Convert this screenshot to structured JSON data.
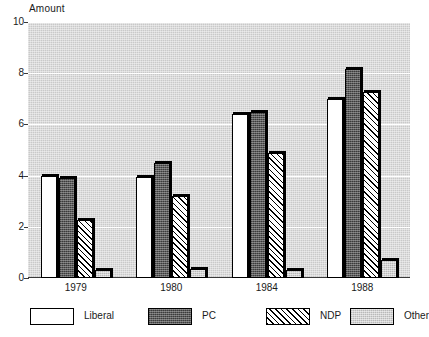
{
  "chart_data": {
    "type": "bar",
    "title": "",
    "subtitle": "",
    "ylabel": "Amount",
    "xlabel": "",
    "categories": [
      "1979",
      "1980",
      "1984",
      "1988"
    ],
    "series": [
      {
        "name": "Liberal",
        "values": [
          4.0,
          3.95,
          6.4,
          7.0
        ],
        "pattern": "solid-white",
        "color": "#ffffff"
      },
      {
        "name": "PC",
        "values": [
          3.9,
          4.5,
          6.5,
          8.15
        ],
        "pattern": "dense-stipple-dark",
        "color": "#5b5b5b"
      },
      {
        "name": "NDP",
        "values": [
          2.25,
          3.2,
          4.9,
          7.25
        ],
        "pattern": "diagonal-hatch",
        "color": "#ffffff"
      },
      {
        "name": "Other",
        "values": [
          0.3,
          0.35,
          0.3,
          0.7
        ],
        "pattern": "light-stipple",
        "color": "#d2d2d2"
      }
    ],
    "ylim": [
      0,
      10
    ],
    "yticks": [
      0,
      2,
      4,
      6,
      8,
      10
    ],
    "ytick_labels": [
      "0",
      "2",
      "4",
      "6",
      "8",
      "10"
    ],
    "grid": "horizontal-white",
    "plot_background": "#c9c9c9",
    "legend_position": "bottom",
    "legend_entries": [
      "Liberal",
      "PC",
      "NDP",
      "Other"
    ]
  }
}
